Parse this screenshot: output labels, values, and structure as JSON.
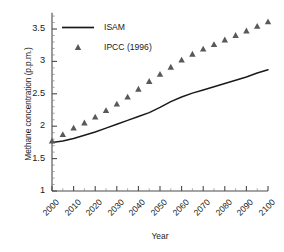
{
  "chart_data": {
    "type": "line",
    "title": "",
    "xlabel": "Year",
    "ylabel": "Methane concentration (p.p.m.)",
    "xlim": [
      2000,
      2100
    ],
    "ylim": [
      1,
      3.75
    ],
    "yticks": [
      "1",
      "1.5",
      "2",
      "2.5",
      "3",
      "3.5"
    ],
    "ytick_values": [
      1,
      1.5,
      2,
      2.5,
      3,
      3.5
    ],
    "xticks": [
      "2000",
      "2010",
      "2020",
      "2030",
      "2040",
      "2050",
      "2060",
      "2070",
      "2080",
      "2090",
      "2100"
    ],
    "xtick_values": [
      2000,
      2010,
      2020,
      2030,
      2040,
      2050,
      2060,
      2070,
      2080,
      2090,
      2100
    ],
    "minor_tick_interval": 5,
    "grid": false,
    "legend_position": "top-left",
    "series": [
      {
        "name": "ISAM",
        "marker": "none",
        "style": "solid-line",
        "color": "#1a1a1a",
        "x": [
          2000,
          2005,
          2010,
          2015,
          2020,
          2025,
          2030,
          2035,
          2040,
          2045,
          2050,
          2055,
          2060,
          2065,
          2070,
          2075,
          2080,
          2085,
          2090,
          2095,
          2100
        ],
        "values": [
          1.75,
          1.77,
          1.81,
          1.86,
          1.91,
          1.97,
          2.03,
          2.09,
          2.15,
          2.21,
          2.29,
          2.38,
          2.45,
          2.51,
          2.56,
          2.61,
          2.66,
          2.71,
          2.76,
          2.82,
          2.87
        ]
      },
      {
        "name": "IPCC (1996)",
        "marker": "triangle",
        "style": "markers",
        "color": "#59595b",
        "x": [
          2000,
          2005,
          2010,
          2015,
          2020,
          2025,
          2030,
          2035,
          2040,
          2045,
          2050,
          2055,
          2060,
          2065,
          2070,
          2075,
          2080,
          2085,
          2090,
          2095,
          2100
        ],
        "values": [
          1.77,
          1.87,
          1.97,
          2.05,
          2.14,
          2.24,
          2.34,
          2.45,
          2.57,
          2.69,
          2.8,
          2.91,
          3.02,
          3.11,
          3.19,
          3.26,
          3.33,
          3.4,
          3.47,
          3.54,
          3.61
        ]
      }
    ]
  },
  "legend": {
    "items": [
      {
        "label": "ISAM",
        "type": "line"
      },
      {
        "label": "IPCC (1996)",
        "type": "triangle"
      }
    ]
  }
}
